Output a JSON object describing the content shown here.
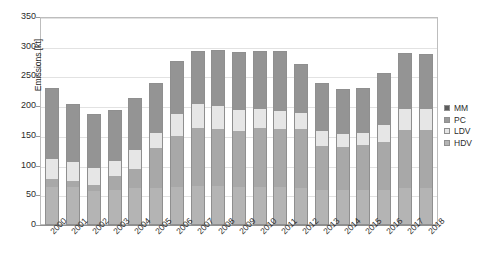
{
  "chart_data": {
    "type": "bar",
    "subtype": "stacked-column",
    "title": "",
    "xlabel": "",
    "ylabel": "Emissions [kt]",
    "ylim": [
      0,
      350
    ],
    "ytick_step": 50,
    "yticks": [
      0,
      50,
      100,
      150,
      200,
      250,
      300,
      350
    ],
    "grid": true,
    "legend_position": "right",
    "categories": [
      "2000",
      "2001",
      "2002",
      "2003",
      "2004",
      "2005",
      "2006",
      "2007",
      "2008",
      "2009",
      "2010",
      "2011",
      "2012",
      "2013",
      "2014",
      "2015",
      "2016",
      "2017",
      "2018"
    ],
    "stack_order_bottom_to_top": [
      "HDV",
      "PC",
      "LDV",
      "MM"
    ],
    "series": [
      {
        "name": "HDV",
        "color": "#b4b4b4",
        "values": [
          62,
          62,
          55,
          58,
          60,
          60,
          62,
          64,
          64,
          62,
          62,
          62,
          60,
          58,
          57,
          57,
          58,
          60,
          60
        ]
      },
      {
        "name": "PC",
        "color": "#a8a8a8",
        "values": [
          13,
          10,
          10,
          22,
          33,
          68,
          86,
          98,
          96,
          95,
          100,
          98,
          100,
          74,
          73,
          76,
          80,
          98,
          98
        ]
      },
      {
        "name": "LDV",
        "color": "#e6e6e6",
        "values": [
          35,
          32,
          29,
          26,
          32,
          26,
          37,
          40,
          38,
          35,
          32,
          31,
          27,
          24,
          22,
          21,
          28,
          36,
          35
        ]
      },
      {
        "name": "MM",
        "color": "#949494",
        "values": [
          117,
          96,
          89,
          84,
          86,
          82,
          87,
          87,
          93,
          96,
          95,
          98,
          81,
          79,
          74,
          73,
          86,
          92,
          91
        ]
      }
    ],
    "totals": [
      227,
      200,
      183,
      190,
      211,
      236,
      272,
      289,
      291,
      288,
      289,
      289,
      268,
      235,
      226,
      227,
      252,
      286,
      284
    ]
  },
  "legend": {
    "items": [
      {
        "label": "MM",
        "key": "mm"
      },
      {
        "label": "PC",
        "key": "pc"
      },
      {
        "label": "LDV",
        "key": "ldv"
      },
      {
        "label": "HDV",
        "key": "hdv"
      }
    ]
  }
}
